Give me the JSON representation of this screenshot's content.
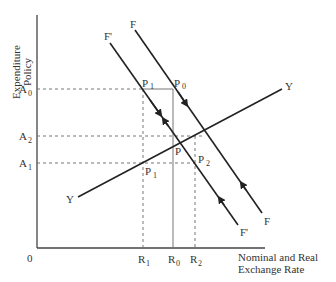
{
  "axes": {
    "y_label_line1": "Expenditure",
    "y_label_line2": "Policy",
    "x_label_line1": "Nominal and Real",
    "x_label_line2": "Exchange Rate",
    "origin": "0"
  },
  "y_ticks": [
    {
      "main": "A",
      "sub": "0"
    },
    {
      "main": "A",
      "sub": "2"
    },
    {
      "main": "A",
      "sub": "1"
    }
  ],
  "x_ticks": [
    {
      "main": "R",
      "sub": "1"
    },
    {
      "main": "R",
      "sub": "0"
    },
    {
      "main": "R",
      "sub": "2"
    }
  ],
  "curves": {
    "F": "F",
    "F_prime": "F'",
    "Y_left": "Y",
    "Y_right": "Y"
  },
  "points": {
    "P1_top": {
      "main": "P",
      "sub": "1"
    },
    "P0": {
      "main": "P",
      "sub": "0"
    },
    "P": {
      "main": "P"
    },
    "P2": {
      "main": "P",
      "sub": "2"
    },
    "P1_bottom": {
      "main": "P",
      "sub": "1"
    }
  }
}
